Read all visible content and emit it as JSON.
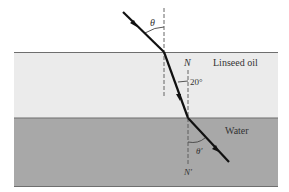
{
  "diagram": {
    "type": "refraction",
    "colors": {
      "background": "#ffffff",
      "oil_layer": "#ebebeb",
      "water_layer": "#a8a8a8",
      "boundary_line": "#6e6e6e",
      "ray": "#111111",
      "normal_line": "#555555"
    },
    "labels": {
      "theta": "θ",
      "normal_top": "N",
      "oil": "Linseed oil",
      "angle_in_oil": "20°",
      "water": "Water",
      "theta_prime": "θ′",
      "normal_bottom": "N′"
    }
  }
}
